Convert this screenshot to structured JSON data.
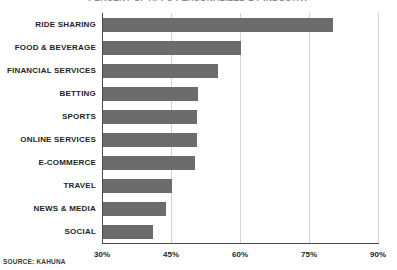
{
  "chart_data": {
    "type": "bar",
    "orientation": "horizontal",
    "title": "PERCENT OF APPS PERSONALIZED BY INDUSTRY",
    "xlabel": "",
    "ylabel": "",
    "xlim": [
      30,
      90
    ],
    "xticks": [
      30,
      45,
      60,
      75,
      90
    ],
    "xtick_labels": [
      "30%",
      "45%",
      "60%",
      "75%",
      "90%"
    ],
    "grid": true,
    "legend": "none",
    "bar_color": "#6c6c6c",
    "categories": [
      "RIDE SHARING",
      "FOOD & BEVERAGE",
      "FINANCIAL SERVICES",
      "BETTING",
      "SPORTS",
      "ONLINE SERVICES",
      "E-COMMERCE",
      "TRAVEL",
      "NEWS & MEDIA",
      "SOCIAL"
    ],
    "values": [
      80,
      60,
      55,
      50.7,
      50.4,
      50.4,
      50,
      45,
      43.7,
      40.9
    ],
    "source": "SOURCE: KAHUNA"
  }
}
